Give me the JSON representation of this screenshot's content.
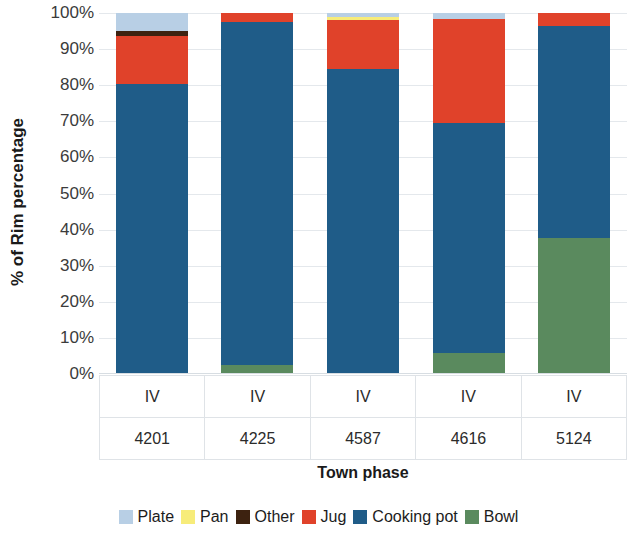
{
  "chart_data": {
    "type": "bar",
    "stacked": true,
    "stack_mode": "percent",
    "title": "",
    "xlabel": "Town phase",
    "ylabel": "% of Rim percentage",
    "ylim": [
      0,
      100
    ],
    "ytick_labels": [
      "0%",
      "10%",
      "20%",
      "30%",
      "40%",
      "50%",
      "60%",
      "70%",
      "80%",
      "90%",
      "100%"
    ],
    "ytick_values": [
      0,
      10,
      20,
      30,
      40,
      50,
      60,
      70,
      80,
      90,
      100
    ],
    "grid": true,
    "legend_position": "bottom",
    "categories": [
      "IV 4201",
      "IV 4225",
      "IV 4587",
      "IV 4616",
      "IV 5124"
    ],
    "category_phase": [
      "IV",
      "IV",
      "IV",
      "IV",
      "IV"
    ],
    "category_code": [
      "4201",
      "4225",
      "4587",
      "4616",
      "5124"
    ],
    "series": [
      {
        "name": "Bowl",
        "color": "#5a8a5e",
        "values": [
          0,
          2.5,
          0,
          5.8,
          37.7
        ]
      },
      {
        "name": "Cooking pot",
        "color": "#1f5c88",
        "values": [
          80.3,
          95.0,
          84.5,
          63.7,
          58.7
        ]
      },
      {
        "name": "Jug",
        "color": "#e0422a",
        "values": [
          13.3,
          2.5,
          13.5,
          28.9,
          3.6
        ]
      },
      {
        "name": "Other",
        "color": "#3d2210",
        "values": [
          1.4,
          0,
          0,
          0,
          0
        ]
      },
      {
        "name": "Pan",
        "color": "#f7ec7a",
        "values": [
          0,
          0,
          0.9,
          0,
          0
        ]
      },
      {
        "name": "Plate",
        "color": "#b8cfe5",
        "values": [
          5.0,
          0,
          1.1,
          1.6,
          0
        ]
      }
    ],
    "legend_order": [
      "Plate",
      "Pan",
      "Other",
      "Jug",
      "Cooking pot",
      "Bowl"
    ]
  },
  "legend": {
    "items": [
      {
        "label": "Plate",
        "color": "#b8cfe5",
        "icon": "legend-swatch-icon"
      },
      {
        "label": "Pan",
        "color": "#f7ec7a",
        "icon": "legend-swatch-icon"
      },
      {
        "label": "Other",
        "color": "#3d2210",
        "icon": "legend-swatch-icon"
      },
      {
        "label": "Jug",
        "color": "#e0422a",
        "icon": "legend-swatch-icon"
      },
      {
        "label": "Cooking pot",
        "color": "#1f5c88",
        "icon": "legend-swatch-icon"
      },
      {
        "label": "Bowl",
        "color": "#5a8a5e",
        "icon": "legend-swatch-icon"
      }
    ]
  }
}
